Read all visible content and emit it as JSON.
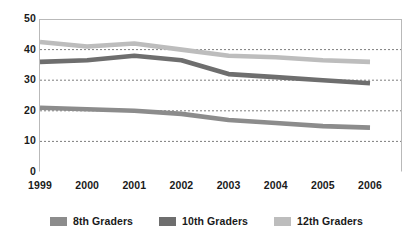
{
  "chart_data": {
    "type": "line",
    "title": "",
    "subtitle": "",
    "xlabel": "",
    "ylabel": "",
    "categories": [
      "1999",
      "2000",
      "2001",
      "2002",
      "2003",
      "2004",
      "2005",
      "2006"
    ],
    "ylim": [
      0,
      50
    ],
    "yticks": [
      "0",
      "10",
      "20",
      "30",
      "40",
      "50"
    ],
    "ytick_values": [
      0,
      10,
      20,
      30,
      40,
      50
    ],
    "grid": "horizontal-dotted",
    "legend_position": "bottom",
    "series": [
      {
        "name": "8th Graders",
        "color": "#8c8c8c",
        "values": [
          21,
          20.5,
          20,
          19,
          17,
          16,
          15,
          14.5
        ]
      },
      {
        "name": "10th Graders",
        "color": "#6e6e6e",
        "values": [
          36,
          36.5,
          38,
          36.5,
          32,
          31,
          30,
          29
        ]
      },
      {
        "name": "12th Graders",
        "color": "#bdbdbd",
        "values": [
          42.5,
          41,
          42,
          40,
          38,
          37.5,
          36.5,
          36
        ]
      }
    ]
  },
  "axes": {
    "y_tick_labels": [
      "50",
      "40",
      "30",
      "20",
      "10",
      "0"
    ],
    "x_tick_labels": [
      "1999",
      "2000",
      "2001",
      "2002",
      "2003",
      "2004",
      "2005",
      "2006"
    ]
  },
  "legend": {
    "entries": [
      {
        "label": "8th Graders",
        "color": "#8c8c8c"
      },
      {
        "label": "10th Graders",
        "color": "#6e6e6e"
      },
      {
        "label": "12th Graders",
        "color": "#bdbdbd"
      }
    ]
  },
  "style": {
    "background": "#ffffff",
    "axis_color": "#b9b9b9",
    "grid_color": "#7d7d7d",
    "text_color": "#1a1a1a"
  }
}
